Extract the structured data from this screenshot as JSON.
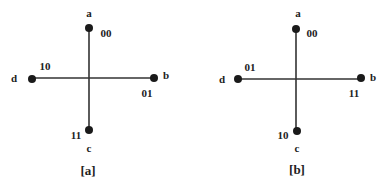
{
  "diagrams": [
    {
      "caption": "[a]",
      "nodes": {
        "a": {
          "name": "a",
          "code": "00"
        },
        "b": {
          "name": "b",
          "code": "01"
        },
        "c": {
          "name": "c",
          "code": "11"
        },
        "d": {
          "name": "d",
          "code": "10"
        }
      }
    },
    {
      "caption": "[b]",
      "nodes": {
        "a": {
          "name": "a",
          "code": "00"
        },
        "b": {
          "name": "b",
          "code": "11"
        },
        "c": {
          "name": "c",
          "code": "10"
        },
        "d": {
          "name": "d",
          "code": "01"
        }
      }
    }
  ],
  "colors": {
    "line": "#333333",
    "dot": "#1a1a1a"
  }
}
